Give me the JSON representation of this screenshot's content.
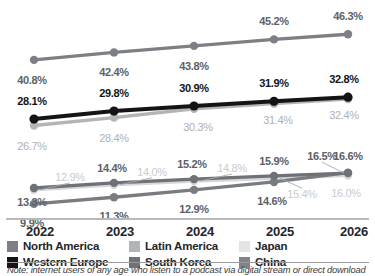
{
  "chart_data": {
    "type": "line",
    "title": "",
    "xlabel": "",
    "ylabel": "",
    "categories": [
      "2022",
      "2023",
      "2024",
      "2025",
      "2026"
    ],
    "ylim": [
      0,
      50
    ],
    "grid": false,
    "legend_position": "bottom",
    "value_suffix": "%",
    "series": [
      {
        "name": "North America",
        "color": "#7c8084",
        "values": [
          40.8,
          42.4,
          43.8,
          45.2,
          46.3
        ],
        "labels": [
          "40.8%",
          "42.4%",
          "43.8%",
          "45.2%",
          "46.3%"
        ]
      },
      {
        "name": "Western Europe",
        "color": "#141414",
        "values": [
          28.1,
          29.8,
          30.9,
          31.9,
          32.8
        ],
        "labels": [
          "28.1%",
          "29.8%",
          "30.9%",
          "31.9%",
          "32.8%"
        ]
      },
      {
        "name": "Latin America",
        "color": "#b2b5b8",
        "values": [
          26.7,
          28.4,
          30.3,
          31.4,
          32.4
        ],
        "labels": [
          "26.7%",
          "28.4%",
          "30.3%",
          "31.4%",
          "32.4%"
        ]
      },
      {
        "name": "South Korea",
        "color": "#6e7276",
        "values": [
          13.3,
          14.4,
          15.2,
          15.9,
          16.5
        ],
        "labels": [
          "13.3%",
          "14.4%",
          "15.2%",
          "15.9%",
          "16.5%"
        ]
      },
      {
        "name": "Japan",
        "color": "#d5d7d9",
        "values": [
          12.9,
          14.0,
          14.8,
          15.4,
          16.0
        ],
        "labels": [
          "12.9%",
          "14.0%",
          "14.8%",
          "15.4%",
          "16.0%"
        ]
      },
      {
        "name": "China",
        "color": "#797d81",
        "values": [
          9.9,
          11.3,
          12.9,
          14.6,
          16.6
        ],
        "labels": [
          "9.9%",
          "11.3%",
          "12.9%",
          "14.6%",
          "16.6%"
        ]
      }
    ]
  },
  "axis": {
    "ticks": [
      "2022",
      "2023",
      "2024",
      "2025",
      "2026"
    ]
  },
  "legend": {
    "items": [
      {
        "label": "North America",
        "color": "#7c8084"
      },
      {
        "label": "Latin America",
        "color": "#b2b5b8"
      },
      {
        "label": "Japan",
        "color": "#e2e4e5"
      },
      {
        "label": "Western Europe",
        "color": "#141414"
      },
      {
        "label": "South Korea",
        "color": "#6e7276"
      },
      {
        "label": "China",
        "color": "#808488"
      }
    ]
  },
  "note": {
    "text": "Note: internet users of any age who listen to a podcast via digital stream or direct download"
  }
}
